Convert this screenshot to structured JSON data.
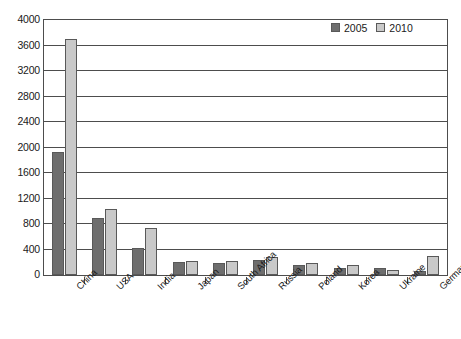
{
  "chart_data": {
    "type": "bar",
    "title": "",
    "subtitle": "",
    "xlabel": "",
    "ylabel": "",
    "ylim": [
      0,
      4000
    ],
    "ytick_step": 400,
    "yticks": [
      4000,
      3600,
      3200,
      2800,
      2400,
      2000,
      1600,
      1200,
      800,
      400,
      0
    ],
    "grid": true,
    "legend_position": "top-right",
    "categories": [
      "China",
      "USA",
      "India",
      "Japan",
      "South Africa",
      "Russia",
      "Poland",
      "Korea",
      "Ukraine",
      "Germany"
    ],
    "series": [
      {
        "name": "2005",
        "color": "#6e6e6e",
        "values": [
          1930,
          890,
          420,
          205,
          190,
          230,
          155,
          110,
          105,
          65
        ]
      },
      {
        "name": "2010",
        "color": "#c9c9c9",
        "values": [
          3710,
          1040,
          735,
          215,
          220,
          290,
          185,
          150,
          75,
          300
        ]
      }
    ]
  },
  "legend": {
    "entries": [
      {
        "label": "2005",
        "swatch": "dark-gray-swatch"
      },
      {
        "label": "2010",
        "swatch": "light-gray-swatch"
      }
    ]
  },
  "axis": {
    "y_ticks": [
      "4000",
      "3600",
      "3200",
      "2800",
      "2400",
      "2000",
      "1600",
      "1200",
      "800",
      "400",
      "0"
    ],
    "x_ticks": [
      "China",
      "USA",
      "India",
      "Japan",
      "South Africa",
      "Russia",
      "Poland",
      "Korea",
      "Ukraine",
      "Germany"
    ]
  },
  "colors": {
    "series_2005": "#6e6e6e",
    "series_2010": "#c9c9c9",
    "axis_line": "#4d4d4d",
    "background": "#ffffff"
  }
}
